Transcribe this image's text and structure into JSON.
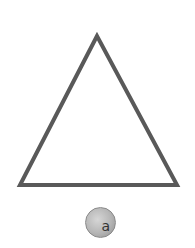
{
  "figure": {
    "shape": "triangle",
    "stroke_color": "#595959",
    "fill_color": "#ffffff",
    "stroke_width": 4,
    "vertices": [
      [
        97,
        36
      ],
      [
        20,
        185
      ],
      [
        177,
        185
      ]
    ]
  },
  "badge": {
    "label": "a",
    "color": "#b0b0b0"
  }
}
